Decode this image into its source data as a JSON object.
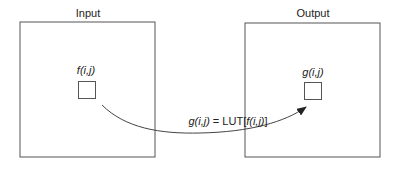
{
  "input": {
    "title": "Input",
    "pixel_label": "f(i,j)"
  },
  "output": {
    "title": "Output",
    "pixel_label": "g(i,j)"
  },
  "mapping": {
    "equation_lhs": "g(i,j)",
    "equation_eq": " = LUT[",
    "equation_arg": "f(i,j)",
    "equation_close": "]"
  },
  "colors": {
    "stroke": "#555555",
    "text": "#222222"
  }
}
